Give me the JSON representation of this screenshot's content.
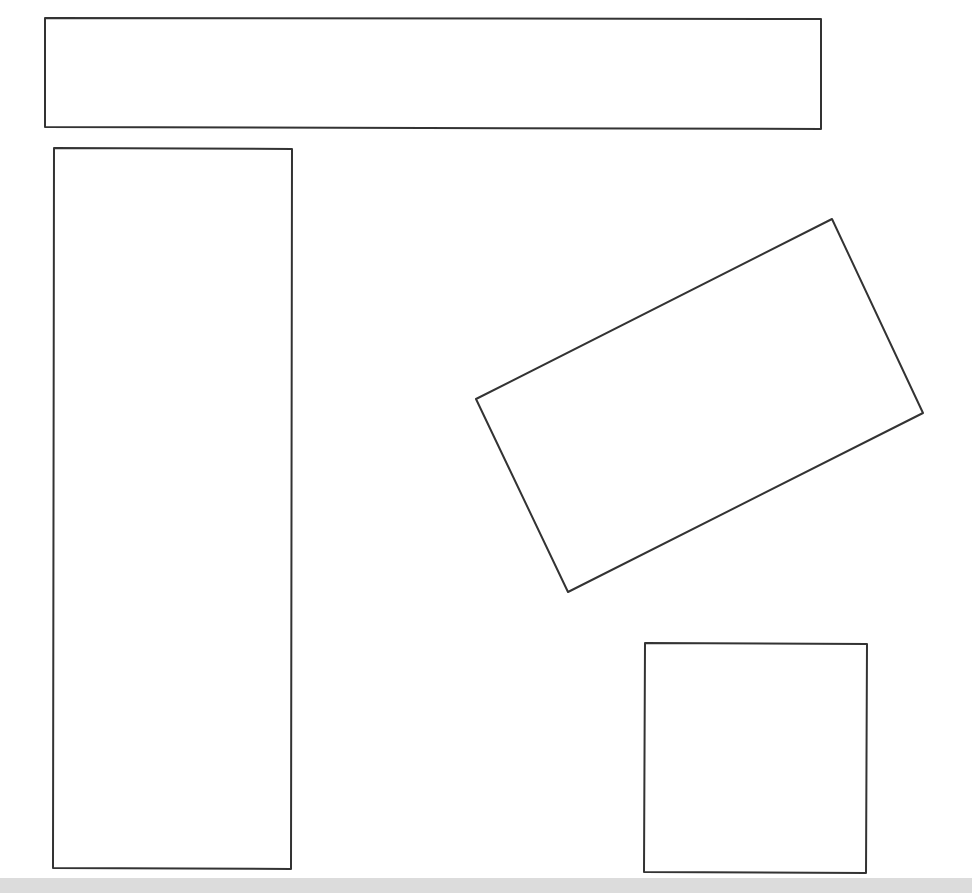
{
  "canvas": {
    "width": 972,
    "height": 893,
    "background": "#ffffff",
    "stroke_color": "#333333",
    "stroke_width": 2
  },
  "bottom_band": {
    "y": 878,
    "height": 15,
    "color": "#dcdcdc"
  },
  "shapes": [
    {
      "id": "wide-rectangle",
      "type": "polygon",
      "points": [
        [
          45,
          18
        ],
        [
          821,
          19
        ],
        [
          821,
          129
        ],
        [
          45,
          127
        ]
      ]
    },
    {
      "id": "tall-rectangle",
      "type": "polygon",
      "points": [
        [
          54,
          148
        ],
        [
          292,
          149
        ],
        [
          291,
          869
        ],
        [
          53,
          868
        ]
      ]
    },
    {
      "id": "rotated-rectangle",
      "type": "polygon",
      "points": [
        [
          832,
          219
        ],
        [
          923,
          413
        ],
        [
          568,
          592
        ],
        [
          476,
          399
        ]
      ]
    },
    {
      "id": "square",
      "type": "polygon",
      "points": [
        [
          645,
          643
        ],
        [
          867,
          644
        ],
        [
          866,
          873
        ],
        [
          644,
          872
        ]
      ]
    }
  ]
}
